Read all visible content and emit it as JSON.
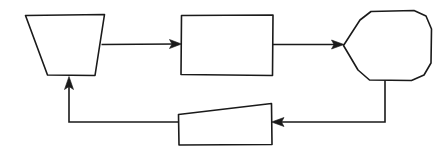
{
  "diagram": {
    "style": "hand-drawn line art",
    "background_color": "#ffffff",
    "line_color": "#1a1a1a",
    "fill_color": "#ffffff",
    "canvas": {
      "width": 439,
      "height": 157
    },
    "nodes": [
      {
        "id": "node-1",
        "shape": "trapezoid-inverted",
        "label": "",
        "position": "left-top",
        "bounds": {
          "x": 25,
          "y": 15,
          "width": 80,
          "height": 60
        }
      },
      {
        "id": "node-2",
        "shape": "rectangle",
        "label": "",
        "position": "center-top",
        "bounds": {
          "x": 181,
          "y": 15,
          "width": 92,
          "height": 60
        }
      },
      {
        "id": "node-3",
        "shape": "hexagon-pointed-left",
        "label": "",
        "position": "right-top",
        "bounds": {
          "x": 343,
          "y": 10,
          "width": 89,
          "height": 71
        }
      },
      {
        "id": "node-4",
        "shape": "trapezoid-sloped-top",
        "label": "",
        "position": "center-bottom",
        "bounds": {
          "x": 178,
          "y": 103,
          "width": 94,
          "height": 42
        }
      }
    ],
    "connectors": [
      {
        "id": "edge-1",
        "from": "node-1",
        "to": "node-2",
        "direction": "right",
        "arrowhead": true,
        "label": ""
      },
      {
        "id": "edge-2",
        "from": "node-2",
        "to": "node-3",
        "direction": "right",
        "arrowhead": true,
        "label": ""
      },
      {
        "id": "edge-3",
        "from": "node-3",
        "to": "node-4",
        "direction": "left",
        "arrowhead": true,
        "label": ""
      },
      {
        "id": "edge-4",
        "from": "node-4",
        "to": "node-1",
        "direction": "up",
        "arrowhead": true,
        "label": ""
      }
    ]
  }
}
